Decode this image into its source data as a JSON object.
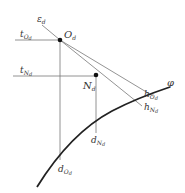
{
  "diagram": {
    "points": {
      "O": {
        "base": "O",
        "sub": "d",
        "x": 60,
        "y": 40
      },
      "N": {
        "base": "N",
        "sub": "d",
        "x": 96,
        "y": 75
      }
    },
    "labels": {
      "epsilon": {
        "base": "ε",
        "sub": "d"
      },
      "tO": {
        "base": "t",
        "sub": "O",
        "sub2": "d"
      },
      "tN": {
        "base": "t",
        "sub": "N",
        "sub2": "d"
      },
      "hO": {
        "base": "h",
        "sub": "O",
        "sub2": "d"
      },
      "hN": {
        "base": "h",
        "sub": "N",
        "sub2": "d"
      },
      "dO": {
        "base": "d",
        "sub": "O",
        "sub2": "d"
      },
      "dN": {
        "base": "d",
        "sub": "N",
        "sub2": "d"
      },
      "phi": {
        "base": "φ"
      }
    },
    "colors": {
      "line": "#777777",
      "curve": "#222222",
      "text": "#333333"
    }
  }
}
